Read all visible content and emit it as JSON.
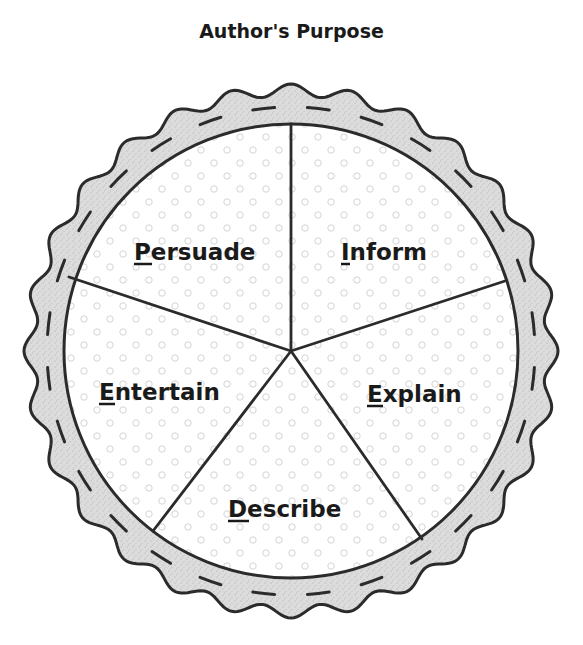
{
  "title": "Author's Purpose",
  "diagram": {
    "type": "pie-diagram",
    "shape": "pie with crimped crust",
    "center": [
      291,
      351
    ],
    "inner_radius": 227,
    "slices": [
      {
        "label": "Persuade",
        "initial": "P",
        "rest": "ersuade",
        "position": "upper-left"
      },
      {
        "label": "Inform",
        "initial": "I",
        "rest": "nform",
        "position": "upper-right"
      },
      {
        "label": "Explain",
        "initial": "E",
        "rest": "xplain",
        "position": "lower-right"
      },
      {
        "label": "Describe",
        "initial": "D",
        "rest": "escribe",
        "position": "bottom"
      },
      {
        "label": "Entertain",
        "initial": "E",
        "rest": "ntertain",
        "position": "lower-left"
      }
    ],
    "colors": {
      "outline": "#2b2b2b",
      "crust_fill": "#d9d9d9",
      "slice_fill": "#ffffff",
      "dot_color": "#cfcfcf",
      "text": "#1a1a1a"
    }
  }
}
